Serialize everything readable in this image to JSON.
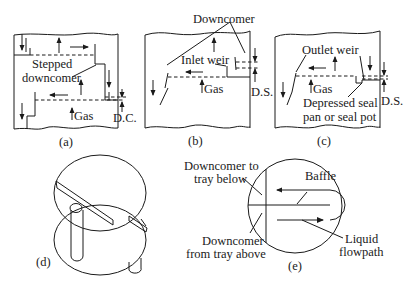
{
  "figure": {
    "panels": [
      {
        "id": "a",
        "caption": "(a)",
        "labels": {
          "stepped_downcomer_line1": "Stepped",
          "stepped_downcomer_line2": "downcomer",
          "gas": "Gas",
          "dim": "D.C."
        }
      },
      {
        "id": "b",
        "caption": "(b)",
        "labels": {
          "downcomer": "Downcomer",
          "inlet_weir": "Inlet weir",
          "gas": "Gas",
          "dim": "D.S."
        }
      },
      {
        "id": "c",
        "caption": "(c)",
        "labels": {
          "outlet_weir": "Outlet weir",
          "gas": "Gas",
          "seal_line1": "Depressed seal",
          "seal_line2": "pan or seal pot",
          "dim": "D.S."
        }
      },
      {
        "id": "d",
        "caption": "(d)",
        "labels": {}
      },
      {
        "id": "e",
        "caption": "(e)",
        "labels": {
          "dc_to_below_line1": "Downcomer to",
          "dc_to_below_line2": "tray below",
          "baffle": "Baffle",
          "dc_from_above_line1": "Downcomer",
          "dc_from_above_line2": "from tray above",
          "liquid_line1": "Liquid",
          "liquid_line2": "flowpath"
        }
      }
    ],
    "colors": {
      "ink": "#1a1a1a",
      "background": "#ffffff"
    }
  }
}
